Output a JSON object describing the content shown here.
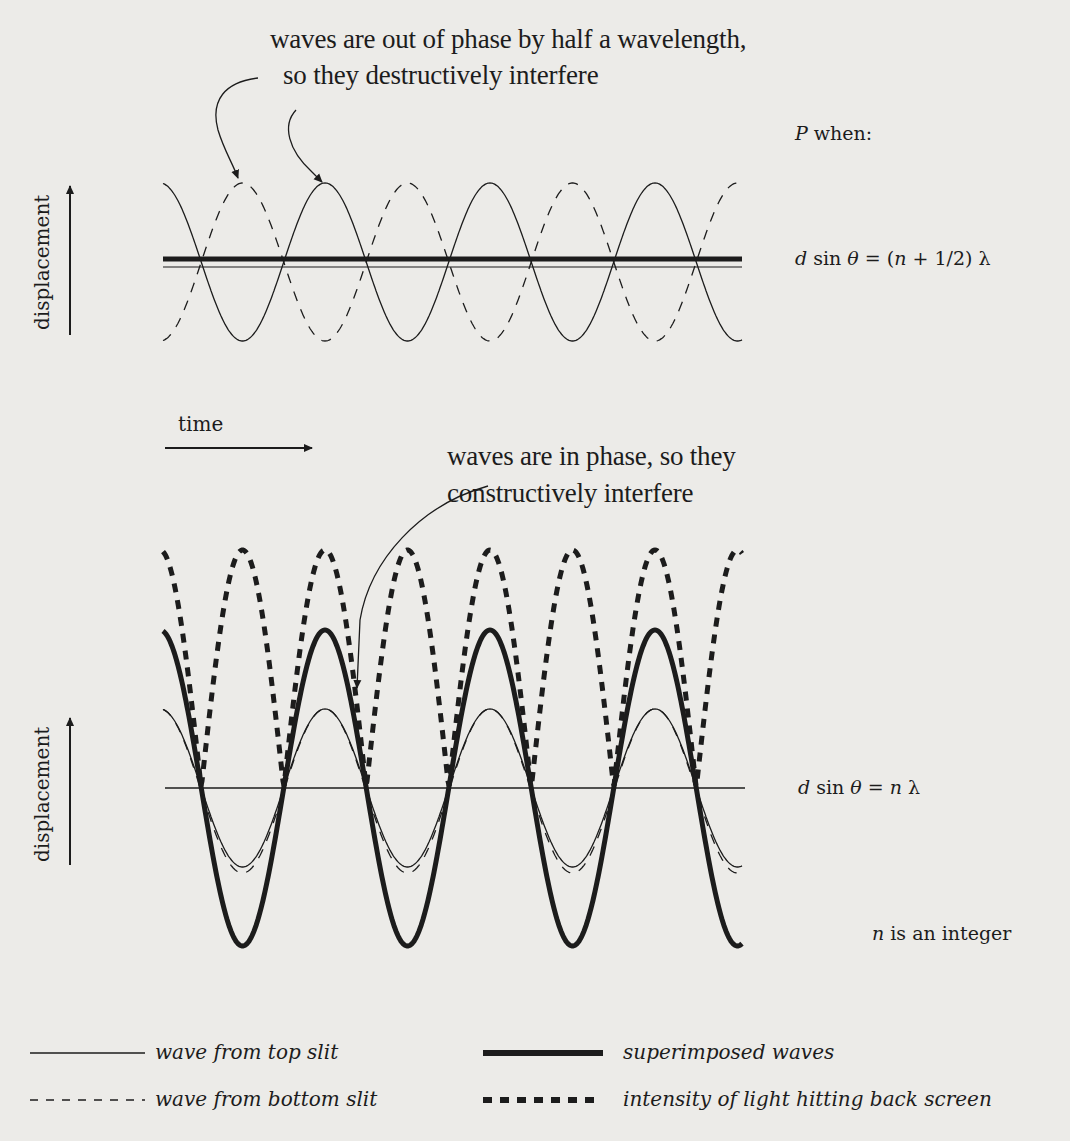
{
  "top_panel": {
    "annotation_line1": "waves are out of phase by half a wavelength,",
    "annotation_line2": "so they destructively interfere",
    "y_axis_label": "displacement",
    "x_axis_label": "time",
    "condition_heading_var": "P",
    "condition_heading_text": " when:",
    "equation": {
      "d": "d",
      "sin": " sin ",
      "theta": "θ",
      "eq": " = (",
      "n": "n",
      "rest": " + 1/2) λ"
    }
  },
  "bottom_panel": {
    "annotation_line1": "waves are in phase, so they",
    "annotation_line2": "constructively interfere",
    "y_axis_label": "displacement",
    "equation": {
      "d": "d",
      "sin": " sin ",
      "theta": "θ",
      "eq": " = ",
      "n": "n",
      "rest": " λ"
    },
    "note_var": "n",
    "note_text": " is an integer"
  },
  "legend": [
    {
      "style": "thin-solid",
      "label": "wave from top slit"
    },
    {
      "style": "thin-dashed",
      "label": "wave from bottom slit"
    },
    {
      "style": "thick-solid",
      "label": "superimposed waves"
    },
    {
      "style": "thick-dashed",
      "label": "intensity of light hitting back screen"
    }
  ],
  "colors": {
    "ink": "#1c1c1c",
    "paper": "#ecebe8"
  },
  "waves": {
    "x_start": 163,
    "x_end": 742,
    "period_px": 165,
    "peak_x": 325,
    "top": {
      "center_y": 262,
      "amplitude": 79
    },
    "bottom": {
      "center_y": 788,
      "thin_amplitude": 79,
      "thick_amplitude": 158,
      "intensity_amplitude": 238
    }
  }
}
